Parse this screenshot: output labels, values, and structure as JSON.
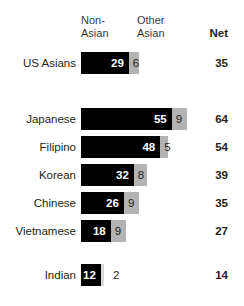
{
  "header": {
    "col_primary": "Non-\nAsian",
    "col_secondary": "Other\nAsian",
    "col_net": "Net"
  },
  "chart_data": {
    "type": "bar",
    "subtype": "stacked-horizontal",
    "title": "",
    "xlabel": "",
    "ylabel": "",
    "grid": false,
    "legend_position": "top",
    "xlim": [
      0,
      64
    ],
    "categories": [
      "US Asians",
      "Japanese",
      "Filipino",
      "Korean",
      "Chinese",
      "Vietnamese",
      "Indian"
    ],
    "series": [
      {
        "name": "Non-Asian",
        "color": "#000000",
        "values": [
          29,
          55,
          48,
          32,
          26,
          18,
          12
        ]
      },
      {
        "name": "Other Asian",
        "color": "#b3b3b3",
        "values": [
          6,
          9,
          5,
          8,
          9,
          9,
          2
        ]
      }
    ],
    "net": {
      "name": "Net",
      "values": [
        35,
        64,
        54,
        39,
        35,
        27,
        14
      ]
    }
  },
  "rows": [
    {
      "label": "US Asians",
      "primary": "29",
      "secondary": "6",
      "net": "35",
      "primary_value": 29,
      "secondary_value": 6,
      "net_value": 35,
      "group": "total"
    },
    {
      "label": "Japanese",
      "primary": "55",
      "secondary": "9",
      "net": "64",
      "primary_value": 55,
      "secondary_value": 9,
      "net_value": 64,
      "group": "subgroup"
    },
    {
      "label": "Filipino",
      "primary": "48",
      "secondary": "5",
      "net": "54",
      "primary_value": 48,
      "secondary_value": 5,
      "net_value": 54,
      "group": "subgroup"
    },
    {
      "label": "Korean",
      "primary": "32",
      "secondary": "8",
      "net": "39",
      "primary_value": 32,
      "secondary_value": 8,
      "net_value": 39,
      "group": "subgroup"
    },
    {
      "label": "Chinese",
      "primary": "26",
      "secondary": "9",
      "net": "35",
      "primary_value": 26,
      "secondary_value": 9,
      "net_value": 35,
      "group": "subgroup"
    },
    {
      "label": "Vietnamese",
      "primary": "18",
      "secondary": "9",
      "net": "27",
      "primary_value": 18,
      "secondary_value": 9,
      "net_value": 27,
      "group": "subgroup"
    },
    {
      "label": "Indian",
      "primary": "12",
      "secondary": "2",
      "net": "14",
      "primary_value": 12,
      "secondary_value": 2,
      "net_value": 14,
      "group": "subgroup"
    }
  ],
  "layout": {
    "bar_origin_x": 81,
    "unit_px": 1.65,
    "bar_height": 22,
    "row_tops": [
      52,
      108,
      136,
      164,
      192,
      220,
      264
    ],
    "colors": {
      "primary": "#000000",
      "secondary": "#b3b3b3",
      "secondary_light": "#d9d9d9",
      "text": "#231f20",
      "background": "#ffffff"
    }
  }
}
